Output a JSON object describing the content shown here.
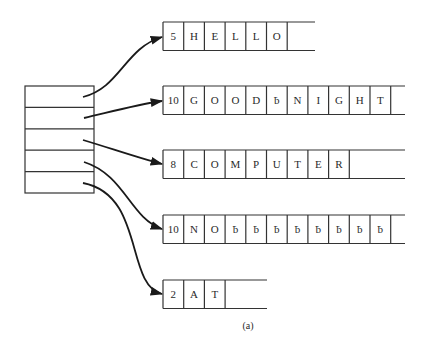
{
  "diagram": {
    "caption": "(a)",
    "pointer_array": {
      "rows": 5
    },
    "blank_symbol": "ƀ",
    "strings": [
      {
        "length": "5",
        "chars": [
          "H",
          "E",
          "L",
          "L",
          "O"
        ],
        "open_end": true
      },
      {
        "length": "10",
        "chars": [
          "G",
          "O",
          "O",
          "D",
          "ƀ",
          "N",
          "I",
          "G",
          "H",
          "T"
        ],
        "open_end": true
      },
      {
        "length": "8",
        "chars": [
          "C",
          "O",
          "M",
          "P",
          "U",
          "T",
          "E",
          "R"
        ],
        "open_end": true
      },
      {
        "length": "10",
        "chars": [
          "N",
          "O",
          "ƀ",
          "ƀ",
          "ƀ",
          "ƀ",
          "ƀ",
          "ƀ",
          "ƀ",
          "ƀ"
        ],
        "open_end": true
      },
      {
        "length": "2",
        "chars": [
          "A",
          "T"
        ],
        "open_end": true
      }
    ]
  }
}
